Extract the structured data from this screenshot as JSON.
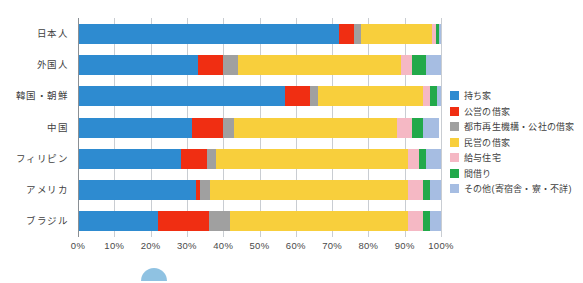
{
  "chart_data": {
    "type": "bar",
    "orientation": "horizontal",
    "stacked": true,
    "normalized": true,
    "title": "",
    "xlabel": "",
    "ylabel": "",
    "xlim": [
      0,
      100
    ],
    "grid": true,
    "legend_position": "right",
    "categories": [
      "日本人",
      "外国人",
      "韓国・朝鮮",
      "中国",
      "フィリピン",
      "アメリカ",
      "ブラジル"
    ],
    "tick_labels": [
      "0%",
      "10%",
      "20%",
      "30%",
      "40%",
      "50%",
      "60%",
      "70%",
      "80%",
      "90%",
      "100%"
    ],
    "tick_values": [
      0,
      10,
      20,
      30,
      40,
      50,
      60,
      70,
      80,
      90,
      100
    ],
    "series": [
      {
        "name": "持ち家",
        "color": "#2e8bd0",
        "values": [
          72.0,
          33.0,
          57.0,
          31.5,
          28.5,
          32.5,
          22.0
        ]
      },
      {
        "name": "公営の借家",
        "color": "#f02e12",
        "values": [
          4.0,
          7.0,
          7.0,
          8.5,
          7.0,
          1.0,
          14.0
        ]
      },
      {
        "name": "都市再生機構・公社の借家",
        "color": "#a0a0a0",
        "values": [
          2.0,
          4.0,
          2.0,
          3.0,
          2.5,
          3.0,
          6.0
        ]
      },
      {
        "name": "民営の借家",
        "color": "#f8cf3c",
        "values": [
          19.5,
          45.0,
          29.0,
          45.0,
          53.0,
          54.5,
          49.0
        ]
      },
      {
        "name": "給与住宅",
        "color": "#f5b8c4",
        "values": [
          1.0,
          3.0,
          2.0,
          4.0,
          3.0,
          4.0,
          4.0
        ]
      },
      {
        "name": "間借り",
        "color": "#22a94a",
        "values": [
          1.0,
          4.0,
          2.0,
          3.0,
          2.0,
          2.0,
          2.0
        ]
      },
      {
        "name": "その他(寄宿舎・寮・不詳)",
        "color": "#a6bde2",
        "values": [
          0.5,
          4.0,
          1.0,
          4.5,
          4.0,
          3.0,
          3.0
        ]
      }
    ]
  },
  "legend": {
    "items": [
      {
        "label": "持ち家",
        "color": "#2e8bd0"
      },
      {
        "label": "公営の借家",
        "color": "#f02e12"
      },
      {
        "label": "都市再生機構・公社の借家",
        "color": "#a0a0a0"
      },
      {
        "label": "民営の借家",
        "color": "#f8cf3c"
      },
      {
        "label": "給与住宅",
        "color": "#f5b8c4"
      },
      {
        "label": "間借り",
        "color": "#22a94a"
      },
      {
        "label": "その他(寄宿舎・寮・不詳)",
        "color": "#a6bde2"
      }
    ]
  }
}
